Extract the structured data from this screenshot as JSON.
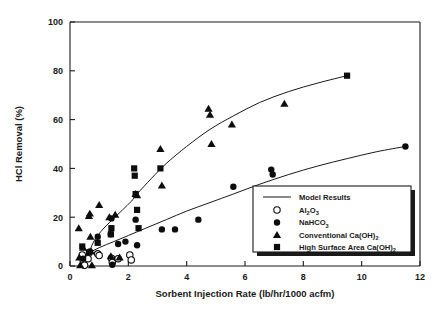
{
  "chart_data": {
    "type": "scatter",
    "title": "",
    "xlabel": "Sorbent Injection Rate (lb/hr/1000 acfm)",
    "ylabel": "HCl Removal (%)",
    "xlim": [
      0,
      12
    ],
    "ylim": [
      0,
      100
    ],
    "xticks": [
      0,
      2,
      4,
      6,
      8,
      10,
      12
    ],
    "yticks": [
      0,
      20,
      40,
      60,
      80,
      100
    ],
    "grid": false,
    "legend_position": "lower-right",
    "legend_entries": [
      {
        "label": "Model Results",
        "marker": "line"
      },
      {
        "label": "Al2O3",
        "label_parts": [
          "Al",
          "2",
          "O",
          "3"
        ],
        "marker": "open-circle"
      },
      {
        "label": "NaHCO3",
        "label_parts": [
          "NaHCO",
          "3"
        ],
        "marker": "filled-circle"
      },
      {
        "label": "Conventional Ca(OH)2",
        "label_parts": [
          "Conventional Ca(OH)",
          "2"
        ],
        "marker": "filled-triangle"
      },
      {
        "label": "High Surface Area Ca(OH)2",
        "label_parts": [
          "High Surface Area Ca(OH)",
          "2"
        ],
        "marker": "filled-square"
      }
    ],
    "series": [
      {
        "name": "Al2O3",
        "marker": "open-circle",
        "points": [
          [
            0.42,
            4.5
          ],
          [
            0.45,
            2.5
          ],
          [
            0.5,
            0.3
          ],
          [
            0.62,
            3.0
          ],
          [
            0.95,
            5.0
          ],
          [
            1.0,
            4.3
          ],
          [
            1.42,
            3.2
          ],
          [
            1.45,
            1.5
          ],
          [
            1.65,
            3.0
          ],
          [
            2.05,
            4.5
          ],
          [
            2.1,
            2.5
          ]
        ]
      },
      {
        "name": "NaHCO3",
        "marker": "filled-circle",
        "points": [
          [
            0.45,
            3.0
          ],
          [
            0.68,
            6.0
          ],
          [
            0.95,
            12.0
          ],
          [
            1.4,
            13.0
          ],
          [
            1.42,
            19.5
          ],
          [
            1.45,
            0.5
          ],
          [
            1.65,
            9.0
          ],
          [
            1.9,
            10.0
          ],
          [
            2.25,
            19.0
          ],
          [
            2.3,
            8.5
          ],
          [
            3.15,
            15.0
          ],
          [
            3.6,
            15.0
          ],
          [
            4.4,
            19.0
          ],
          [
            5.6,
            32.5
          ],
          [
            6.9,
            39.5
          ],
          [
            6.95,
            37.5
          ],
          [
            11.5,
            49.0
          ]
        ]
      },
      {
        "name": "Conventional Ca(OH)2",
        "marker": "filled-triangle",
        "points": [
          [
            0.3,
            15.5
          ],
          [
            0.32,
            3.5
          ],
          [
            0.35,
            0.3
          ],
          [
            0.45,
            7.5
          ],
          [
            0.65,
            20.5
          ],
          [
            0.68,
            21.5
          ],
          [
            0.7,
            12.0
          ],
          [
            0.72,
            6.0
          ],
          [
            0.75,
            0.3
          ],
          [
            1.0,
            25.0
          ],
          [
            1.35,
            20.0
          ],
          [
            1.4,
            4.0
          ],
          [
            1.55,
            21.0
          ],
          [
            1.7,
            3.5
          ],
          [
            2.25,
            29.5
          ],
          [
            2.3,
            29.0
          ],
          [
            3.1,
            48.0
          ],
          [
            3.15,
            33.0
          ],
          [
            4.75,
            64.5
          ],
          [
            4.8,
            62.0
          ],
          [
            4.85,
            50.0
          ],
          [
            5.55,
            58.0
          ],
          [
            7.35,
            66.5
          ]
        ]
      },
      {
        "name": "High Surface Area Ca(OH)2",
        "marker": "filled-square",
        "points": [
          [
            0.42,
            8.0
          ],
          [
            0.65,
            5.5
          ],
          [
            0.95,
            9.5
          ],
          [
            1.4,
            13.0
          ],
          [
            1.42,
            15.5
          ],
          [
            2.2,
            40.0
          ],
          [
            2.22,
            37.0
          ],
          [
            2.25,
            29.5
          ],
          [
            2.3,
            23.0
          ],
          [
            2.35,
            15.5
          ],
          [
            3.1,
            40.0
          ],
          [
            9.5,
            78.0
          ]
        ]
      }
    ],
    "model_curves": [
      {
        "name": "Model Results - Ca(OH)2 upper curve",
        "points": [
          [
            0.52,
            0.5
          ],
          [
            0.62,
            4.0
          ],
          [
            0.75,
            8.5
          ],
          [
            0.95,
            12.5
          ],
          [
            1.2,
            16.0
          ],
          [
            1.5,
            19.5
          ],
          [
            1.8,
            23.0
          ],
          [
            2.1,
            26.5
          ],
          [
            2.3,
            29.5
          ],
          [
            2.8,
            36.0
          ],
          [
            3.3,
            42.0
          ],
          [
            4.0,
            49.0
          ],
          [
            4.8,
            56.0
          ],
          [
            5.6,
            61.5
          ],
          [
            6.5,
            67.0
          ],
          [
            7.5,
            71.5
          ],
          [
            8.5,
            75.0
          ],
          [
            9.5,
            78.0
          ]
        ]
      },
      {
        "name": "Model Results - NaHCO3 lower curve",
        "points": [
          [
            0.3,
            2.5
          ],
          [
            0.6,
            5.0
          ],
          [
            1.0,
            7.5
          ],
          [
            1.5,
            10.0
          ],
          [
            2.0,
            12.5
          ],
          [
            2.6,
            15.5
          ],
          [
            3.3,
            19.0
          ],
          [
            4.0,
            22.5
          ],
          [
            4.8,
            26.0
          ],
          [
            5.6,
            29.5
          ],
          [
            6.5,
            33.5
          ],
          [
            7.5,
            37.5
          ],
          [
            8.5,
            41.0
          ],
          [
            9.5,
            44.0
          ],
          [
            10.5,
            46.8
          ],
          [
            11.5,
            49.0
          ]
        ]
      }
    ]
  }
}
